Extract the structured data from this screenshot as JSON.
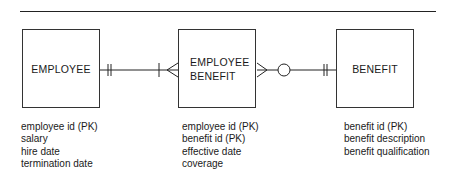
{
  "diagram": {
    "type": "entity-relationship",
    "entities": [
      {
        "name": "EMPLOYEE",
        "attributes": [
          "employee id (PK)",
          "salary",
          "hire date",
          "termination date"
        ]
      },
      {
        "name_line1": "EMPLOYEE",
        "name_line2": "BENEFIT",
        "attributes": [
          "employee id (PK)",
          "benefit id (PK)",
          "effective date",
          "coverage"
        ]
      },
      {
        "name": "BENEFIT",
        "attributes": [
          "benefit id (PK)",
          "benefit description",
          "benefit qualification"
        ]
      }
    ],
    "relationships": [
      {
        "from": "EMPLOYEE",
        "to": "EMPLOYEE BENEFIT",
        "from_cardinality": "one and only one",
        "to_cardinality": "one or many"
      },
      {
        "from": "EMPLOYEE BENEFIT",
        "to": "BENEFIT",
        "from_cardinality": "zero or many",
        "to_cardinality": "one and only one"
      }
    ],
    "colors": {
      "line": "#222222",
      "text": "#1a1a1a",
      "background": "#ffffff"
    }
  }
}
